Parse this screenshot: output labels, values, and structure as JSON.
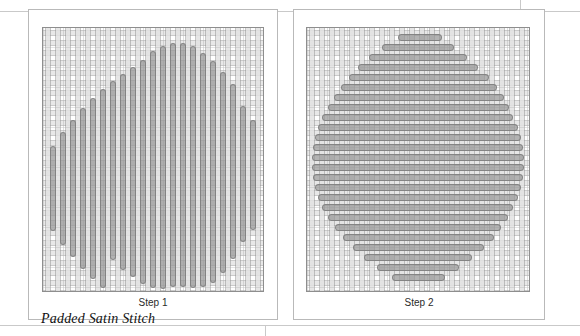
{
  "figure": {
    "caption": "Padded Satin Stitch",
    "background_color": "#ffffff",
    "panel_border_color": "#b9b9b9",
    "fabric_border_color": "#8e8e8e",
    "stitch_fill_color": "#969696",
    "stitch_outline_color": "#7e7e7e",
    "weave_thread_color": "#e2e2e2",
    "rule_color": "#c9c9c9"
  },
  "panels": [
    {
      "id": "step-1",
      "step_label": "Step 1",
      "stitch_direction": "vertical",
      "stitch_count": 21,
      "description": "Vertical padding stitches filling a circular shape"
    },
    {
      "id": "step-2",
      "step_label": "Step 2",
      "stitch_direction": "horizontal",
      "stitch_count": 25,
      "description": "Horizontal satin stitches worked over the padding"
    }
  ],
  "chart_data": {
    "type": "scatter",
    "title": "Padded Satin Stitch",
    "xlabel": "",
    "ylabel": "",
    "note": "Stitch geometry in fabric-panel pixel coordinates (origin at fabric top-left).",
    "series": [
      {
        "name": "Step 1 vertical padding stitches",
        "orientation": "vertical",
        "stitch_width": 6,
        "values": [
          {
            "x": 7,
            "y": 118,
            "length": 85
          },
          {
            "x": 17,
            "y": 104,
            "length": 113
          },
          {
            "x": 27,
            "y": 92,
            "length": 137
          },
          {
            "x": 37,
            "y": 80,
            "length": 161
          },
          {
            "x": 47,
            "y": 70,
            "length": 181
          },
          {
            "x": 57,
            "y": 61,
            "length": 199
          },
          {
            "x": 67,
            "y": 53,
            "length": 179
          },
          {
            "x": 77,
            "y": 46,
            "length": 196
          },
          {
            "x": 87,
            "y": 39,
            "length": 210
          },
          {
            "x": 97,
            "y": 32,
            "length": 224
          },
          {
            "x": 107,
            "y": 23,
            "length": 237
          },
          {
            "x": 117,
            "y": 18,
            "length": 243
          },
          {
            "x": 127,
            "y": 15,
            "length": 244
          },
          {
            "x": 137,
            "y": 15,
            "length": 244
          },
          {
            "x": 147,
            "y": 18,
            "length": 242
          },
          {
            "x": 157,
            "y": 25,
            "length": 234
          },
          {
            "x": 167,
            "y": 33,
            "length": 222
          },
          {
            "x": 177,
            "y": 44,
            "length": 201
          },
          {
            "x": 187,
            "y": 56,
            "length": 175
          },
          {
            "x": 197,
            "y": 78,
            "length": 136
          },
          {
            "x": 207,
            "y": 92,
            "length": 110
          }
        ]
      },
      {
        "name": "Step 2 horizontal satin stitches",
        "orientation": "horizontal",
        "stitch_height": 7,
        "values": [
          {
            "y": 6,
            "x": 91,
            "length": 44
          },
          {
            "y": 16,
            "x": 75,
            "length": 72
          },
          {
            "y": 26,
            "x": 62,
            "length": 98
          },
          {
            "y": 36,
            "x": 51,
            "length": 120
          },
          {
            "y": 46,
            "x": 42,
            "length": 140
          },
          {
            "y": 56,
            "x": 34,
            "length": 156
          },
          {
            "y": 66,
            "x": 27,
            "length": 170
          },
          {
            "y": 76,
            "x": 21,
            "length": 181
          },
          {
            "y": 86,
            "x": 15,
            "length": 191
          },
          {
            "y": 96,
            "x": 11,
            "length": 200
          },
          {
            "y": 106,
            "x": 8,
            "length": 206
          },
          {
            "y": 116,
            "x": 6,
            "length": 210
          },
          {
            "y": 126,
            "x": 5,
            "length": 212
          },
          {
            "y": 136,
            "x": 5,
            "length": 212
          },
          {
            "y": 146,
            "x": 6,
            "length": 210
          },
          {
            "y": 156,
            "x": 8,
            "length": 206
          },
          {
            "y": 166,
            "x": 11,
            "length": 200
          },
          {
            "y": 176,
            "x": 15,
            "length": 191
          },
          {
            "y": 186,
            "x": 21,
            "length": 180
          },
          {
            "y": 196,
            "x": 28,
            "length": 166
          },
          {
            "y": 206,
            "x": 36,
            "length": 151
          },
          {
            "y": 216,
            "x": 46,
            "length": 131
          },
          {
            "y": 226,
            "x": 57,
            "length": 108
          },
          {
            "y": 236,
            "x": 70,
            "length": 82
          },
          {
            "y": 246,
            "x": 85,
            "length": 53
          }
        ]
      }
    ]
  }
}
